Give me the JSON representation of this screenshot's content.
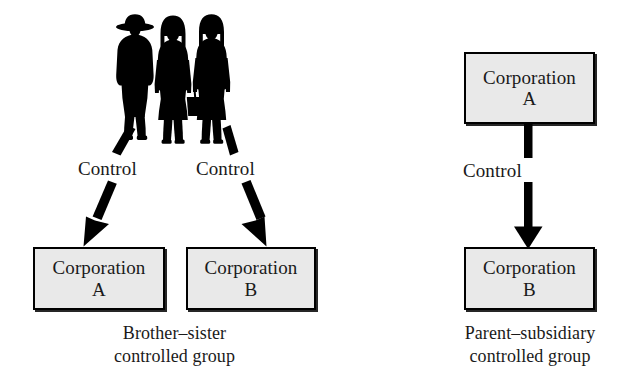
{
  "figure": {
    "background_color": "#ffffff",
    "ink_color": "#000000",
    "box_fill_color": "#e9e9e9",
    "box_border_color": "#000000"
  },
  "groups": [
    {
      "id": "brother-sister",
      "caption_line1": "Brother–sister",
      "caption_line2": "controlled group",
      "owner_icon": "three-people-silhouette-icon",
      "owner_count": 3,
      "boxes": [
        {
          "id": "left-a",
          "line1": "Corporation",
          "line2": "A"
        },
        {
          "id": "left-b",
          "line1": "Corporation",
          "line2": "B"
        }
      ],
      "edges": [
        {
          "id": "owners-to-a",
          "label": "Control",
          "style": "dashed-arrow",
          "direction": "down-left"
        },
        {
          "id": "owners-to-b",
          "label": "Control",
          "style": "dashed-arrow",
          "direction": "down-right"
        }
      ]
    },
    {
      "id": "parent-subsidiary",
      "caption_line1": "Parent–subsidiary",
      "caption_line2": "controlled group",
      "boxes": [
        {
          "id": "right-a",
          "line1": "Corporation",
          "line2": "A"
        },
        {
          "id": "right-b",
          "line1": "Corporation",
          "line2": "B"
        }
      ],
      "edges": [
        {
          "id": "a-to-b",
          "label": "Control",
          "style": "solid-arrow",
          "direction": "down"
        }
      ]
    }
  ],
  "labels": {
    "control_left": "Control",
    "control_middle": "Control",
    "control_right": "Control"
  },
  "boxes": {
    "left_a": {
      "line1": "Corporation",
      "line2": "A"
    },
    "left_b": {
      "line1": "Corporation",
      "line2": "B"
    },
    "right_a": {
      "line1": "Corporation",
      "line2": "A"
    },
    "right_b": {
      "line1": "Corporation",
      "line2": "B"
    }
  },
  "captions": {
    "brother_sister_line1": "Brother–sister",
    "brother_sister_line2": "controlled group",
    "parent_subsidiary_line1": "Parent–subsidiary",
    "parent_subsidiary_line2": "controlled group"
  }
}
